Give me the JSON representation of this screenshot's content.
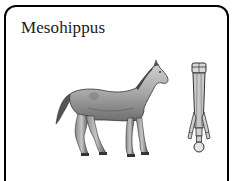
{
  "card": {
    "title": "Mesohippus",
    "illustrations": [
      {
        "name": "horse-illustration",
        "subject": "Mesohippus side view"
      },
      {
        "name": "leg-bone-illustration",
        "subject": "Mesohippus foot / leg bones"
      }
    ]
  },
  "colors": {
    "border": "#000000",
    "background": "#ffffff",
    "title_text": "#1a1a1a",
    "horse_fill": "#a9a9a9",
    "bone_fill": "#c8c8c8"
  }
}
